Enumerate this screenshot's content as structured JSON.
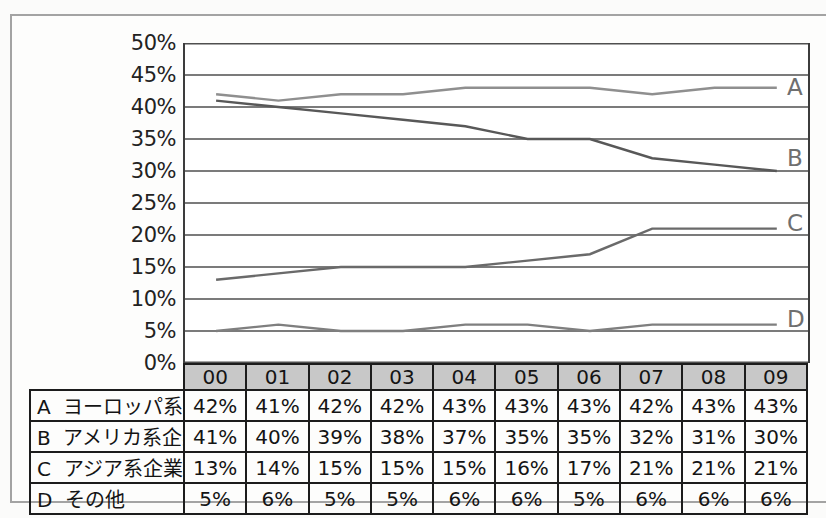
{
  "figure": {
    "background": "#fdfdfc",
    "frame_color": "#a3a3a3"
  },
  "chart_data": {
    "type": "line",
    "title": "",
    "categories": [
      "00",
      "01",
      "02",
      "03",
      "04",
      "05",
      "06",
      "07",
      "08",
      "09"
    ],
    "y_axis": {
      "ticks": [
        "50%",
        "45%",
        "40%",
        "35%",
        "30%",
        "25%",
        "20%",
        "15%",
        "10%",
        "5%",
        "0%"
      ],
      "min": 0,
      "max": 50,
      "step": 5,
      "unit": "%"
    },
    "series": [
      {
        "key": "A",
        "name": "ヨーロッパ系企業",
        "values": [
          42,
          41,
          42,
          42,
          43,
          43,
          43,
          42,
          43,
          43
        ],
        "color": "#8f8f8f"
      },
      {
        "key": "B",
        "name": "アメリカ系企業",
        "values": [
          41,
          40,
          39,
          38,
          37,
          35,
          35,
          32,
          31,
          30
        ],
        "color": "#585858"
      },
      {
        "key": "C",
        "name": "アジア系企業",
        "values": [
          13,
          14,
          15,
          15,
          15,
          16,
          17,
          21,
          21,
          21
        ],
        "color": "#6a6a6a"
      },
      {
        "key": "D",
        "name": "その他",
        "values": [
          5,
          6,
          5,
          5,
          6,
          6,
          5,
          6,
          6,
          6
        ],
        "color": "#7f7f7f"
      }
    ],
    "value_suffix": "%",
    "grid": true,
    "gridline_color": "#4f4f4f",
    "legend_position": "series-end-labels-right-and-table-below",
    "table_header_fill": "#c8c8c8",
    "table_border_color": "#1c1c1c"
  }
}
